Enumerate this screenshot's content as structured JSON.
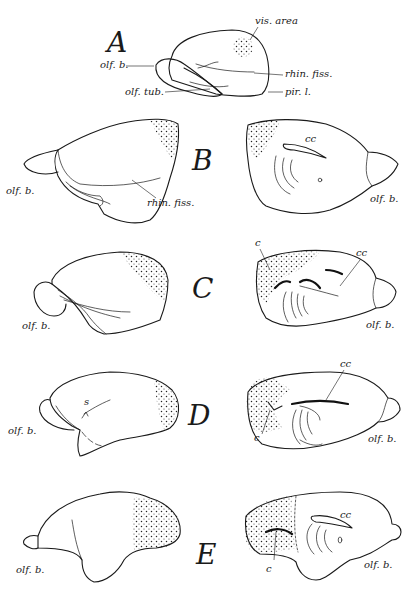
{
  "figure": {
    "panels": [
      {
        "id": "A",
        "letter": "A",
        "views": [
          {
            "side": "lateral",
            "labels": {
              "vis_area": "vis. area",
              "olf_b": "olf. b.",
              "rhin_fiss": "rhin. fiss.",
              "olf_tub": "olf. tub.",
              "pir_l": "pir. l."
            }
          }
        ]
      },
      {
        "id": "B",
        "letter": "B",
        "views": [
          {
            "side": "lateral",
            "labels": {
              "olf_b": "olf. b.",
              "rhin_fiss": "rhin. fiss."
            }
          },
          {
            "side": "medial",
            "labels": {
              "cc": "cc",
              "olf_b": "olf. b."
            }
          }
        ]
      },
      {
        "id": "C",
        "letter": "C",
        "views": [
          {
            "side": "lateral",
            "labels": {
              "olf_b": "olf. b."
            }
          },
          {
            "side": "medial",
            "labels": {
              "c": "c",
              "cc": "cc",
              "olf_b": "olf. b."
            }
          }
        ]
      },
      {
        "id": "D",
        "letter": "D",
        "views": [
          {
            "side": "lateral",
            "labels": {
              "s": "s",
              "olf_b": "olf. b."
            }
          },
          {
            "side": "medial",
            "labels": {
              "cc": "cc",
              "c": "c",
              "olf_b": "olf. b."
            }
          }
        ]
      },
      {
        "id": "E",
        "letter": "E",
        "views": [
          {
            "side": "lateral",
            "labels": {
              "olf_b": "olf. b."
            }
          },
          {
            "side": "medial",
            "labels": {
              "cc": "cc",
              "c": "c",
              "olf_b": "olf. b."
            }
          }
        ]
      }
    ],
    "stipple_meaning": "visual area (dotted region)",
    "colors": {
      "ink": "#1a1a1a",
      "paper": "#ffffff"
    }
  }
}
